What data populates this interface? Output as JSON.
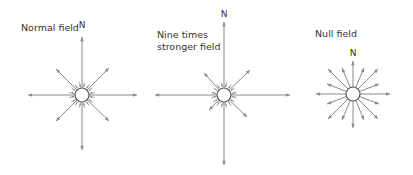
{
  "diagrams": [
    {
      "label_lines": [
        "Normal field"
      ],
      "north": "N",
      "label_x": 21,
      "label_y": 22,
      "n_x": 82,
      "n_y": 20,
      "center": [
        82,
        95
      ],
      "radius": 7,
      "arrows": [
        [
          82,
          37
        ],
        [
          82,
          150
        ],
        [
          28,
          95
        ],
        [
          137,
          95
        ],
        [
          56,
          69
        ],
        [
          109,
          68
        ],
        [
          56,
          121
        ],
        [
          109,
          121
        ]
      ],
      "inner_arrows": true
    },
    {
      "label_lines": [
        "Nine times",
        "stronger field"
      ],
      "north": "N",
      "label_x": 157,
      "label_y": 30,
      "n_x": 224,
      "n_y": 10,
      "center": [
        224,
        95
      ],
      "radius": 7,
      "arrows": [
        [
          224,
          22
        ],
        [
          224,
          165
        ],
        [
          155,
          95
        ],
        [
          290,
          95
        ],
        [
          204,
          73
        ],
        [
          250,
          70
        ],
        [
          209,
          110
        ],
        [
          247,
          117
        ]
      ],
      "inner_arrows": true
    },
    {
      "label_lines": [
        "Null field"
      ],
      "north": "N",
      "label_x": 315,
      "label_y": 28,
      "n_x": 353,
      "n_y": 48,
      "center": [
        353,
        94
      ],
      "radius": 7,
      "arrows": [
        [
          353,
          61
        ],
        [
          353,
          128
        ],
        [
          316,
          94
        ],
        [
          390,
          94
        ],
        [
          328,
          69
        ],
        [
          378,
          69
        ],
        [
          328,
          119
        ],
        [
          378,
          119
        ],
        [
          342,
          68
        ],
        [
          364,
          68
        ],
        [
          342,
          120
        ],
        [
          364,
          120
        ],
        [
          327,
          84
        ],
        [
          379,
          84
        ],
        [
          327,
          104
        ],
        [
          379,
          104
        ]
      ],
      "inner_arrows": false
    }
  ],
  "colors": {
    "arrow": "#8a8a8a",
    "circle": "#555555",
    "text": "#333333"
  }
}
